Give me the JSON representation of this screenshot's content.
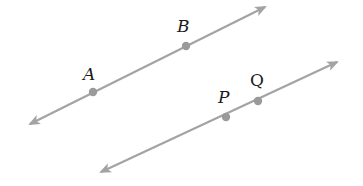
{
  "diagram": {
    "type": "parallel-lines",
    "colors": {
      "line": "#a3a3a3",
      "point": "#9a9a9a",
      "label": "#1a1a1a",
      "background": "#ffffff"
    },
    "lines": [
      {
        "id": "line-ab",
        "start": [
          30,
          124
        ],
        "end": [
          265,
          7
        ],
        "points": [
          {
            "label": "A",
            "x": 93,
            "y": 92,
            "lx": 83,
            "ly": 80
          },
          {
            "label": "B",
            "x": 186,
            "y": 46,
            "lx": 177,
            "ly": 32
          }
        ]
      },
      {
        "id": "line-pq",
        "start": [
          101,
          172
        ],
        "end": [
          337,
          62
        ],
        "points": [
          {
            "label": "P",
            "x": 226,
            "y": 117,
            "lx": 218,
            "ly": 103
          },
          {
            "label": "Q",
            "x": 258,
            "y": 101,
            "lx": 250,
            "ly": 86
          }
        ]
      }
    ]
  }
}
